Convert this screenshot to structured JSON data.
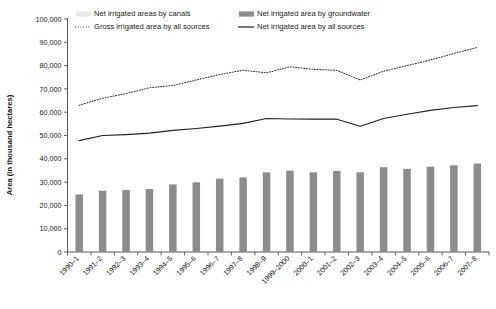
{
  "chart_data": {
    "type": "bar",
    "title": "",
    "xlabel": "",
    "ylabel": "Area (in thousand hectares)",
    "ylim": [
      0,
      100000
    ],
    "ytick_step": 10000,
    "grid": false,
    "legend_position": "top",
    "categories": [
      "1990–1",
      "1991–2",
      "1992–3",
      "1993–4",
      "1994–5",
      "1995–6",
      "1996–7",
      "1997–8",
      "1998–9",
      "1999–2000",
      "2000–1",
      "2001–2",
      "2002–3",
      "2003–4",
      "2004–5",
      "2005–6",
      "2006–7",
      "2007–8"
    ],
    "ytick_labels": [
      "0",
      "10,000",
      "20,000",
      "30,000",
      "40,000",
      "50,000",
      "60,000",
      "70,000",
      "80,000",
      "90,000",
      "100,000"
    ],
    "ytick_values": [
      0,
      10000,
      20000,
      30000,
      40000,
      50000,
      60000,
      70000,
      80000,
      90000,
      100000
    ],
    "series": [
      {
        "name": "Net irrigated areas by canals",
        "render": "bar",
        "color": "#e8e8e8",
        "values": [
          17453,
          17316,
          16973,
          17044,
          17121,
          17120,
          17312,
          17363,
          17238,
          16560,
          15951,
          15029,
          14450,
          14259,
          14550,
          14800,
          16500,
          16800
        ]
      },
      {
        "name": "Net irrigated area by groundwater",
        "render": "bar",
        "color": "#8c8c8c",
        "values": [
          24700,
          26300,
          26600,
          27000,
          29000,
          29900,
          31500,
          32000,
          34200,
          34900,
          34200,
          34800,
          34200,
          36400,
          35700,
          36600,
          37200,
          38000
        ]
      },
      {
        "name": "Gross irrigated area by all sources",
        "render": "dotted-line",
        "color": "#333333",
        "values": [
          63000,
          66000,
          68000,
          70500,
          71500,
          73800,
          76200,
          78000,
          76900,
          79500,
          78400,
          78000,
          73800,
          77600,
          80000,
          82400,
          85200,
          87800
        ]
      },
      {
        "name": "Net irrigated area by all sources",
        "render": "solid-line",
        "color": "#222222",
        "values": [
          47800,
          50000,
          50400,
          51000,
          52200,
          53000,
          54000,
          55200,
          57300,
          57100,
          57000,
          57000,
          54000,
          57300,
          59100,
          60800,
          62000,
          62800
        ]
      }
    ],
    "legend": [
      {
        "label": "Net irrigated areas by canals",
        "marker": "bar",
        "color": "#e8e8e8"
      },
      {
        "label": "Net irrigated area by groundwater",
        "marker": "bar",
        "color": "#8c8c8c"
      },
      {
        "label": "Gross irrigated area by all sources",
        "marker": "dotted-line",
        "color": "#333333"
      },
      {
        "label": "Net irrigated area by all sources",
        "marker": "solid-line",
        "color": "#222222"
      }
    ]
  }
}
